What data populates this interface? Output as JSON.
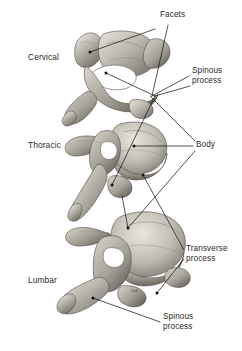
{
  "figure": {
    "background_color": "#ffffff",
    "line_color": "#1a1a1a",
    "text_color": "#2b2b2b",
    "bone_light": "#ded9d0",
    "bone_mid": "#a9a49b",
    "bone_dark": "#5d5a55",
    "artist_signature": "JWK"
  },
  "region_labels": [
    {
      "id": "cervical",
      "text": "Cervical",
      "x": 28,
      "y": 52
    },
    {
      "id": "thoracic",
      "text": "Thoracic",
      "x": 28,
      "y": 140
    },
    {
      "id": "lumbar",
      "text": "Lumbar",
      "x": 28,
      "y": 275
    }
  ],
  "callouts": [
    {
      "id": "facets",
      "lines": [
        "Facets"
      ],
      "x": 160,
      "y": 10,
      "leaders": [
        {
          "points": "155,29 90,52",
          "dot": "90,52"
        },
        {
          "points": "168,25 152,96",
          "dot": ""
        }
      ]
    },
    {
      "id": "spinous-process-upper",
      "lines": [
        "Spinous",
        "process"
      ],
      "x": 192,
      "y": 66,
      "leaders": [
        {
          "points": "189,76 152,96",
          "dot": ""
        },
        {
          "points": "190,86 155,96",
          "dot": ""
        },
        {
          "points": "155,96 106,73",
          "dot": "106,73"
        },
        {
          "points": "155,96 112,185",
          "dot": "112,185"
        }
      ]
    },
    {
      "id": "body",
      "lines": [
        "Body"
      ],
      "x": 196,
      "y": 140,
      "leaders": [
        {
          "points": "193,146 134,146",
          "dot": "134,146"
        },
        {
          "points": "195,141 150,96",
          "dot": ""
        },
        {
          "points": "195,151 128,228",
          "dot": "128,228"
        },
        {
          "points": "128,228 122,196",
          "dot": ""
        }
      ]
    },
    {
      "id": "transverse-process",
      "lines": [
        "Transverse",
        "process"
      ],
      "x": 186,
      "y": 244,
      "leaders": [
        {
          "points": "184,250 143,175",
          "dot": "143,175"
        },
        {
          "points": "184,259 157,293",
          "dot": "157,293"
        }
      ]
    },
    {
      "id": "spinous-process-lower",
      "lines": [
        "Spinous",
        "process"
      ],
      "x": 163,
      "y": 312,
      "leaders": [
        {
          "points": "160,322 93,298",
          "dot": "93,298"
        }
      ]
    }
  ],
  "vertebrae": [
    {
      "id": "cervical-vertebra",
      "region": "Cervical"
    },
    {
      "id": "thoracic-vertebra",
      "region": "Thoracic"
    },
    {
      "id": "lumbar-vertebra",
      "region": "Lumbar"
    }
  ]
}
